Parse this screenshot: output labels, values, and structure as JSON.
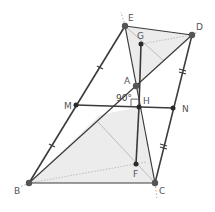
{
  "diagram": {
    "type": "geometry",
    "colors": {
      "line": "#3a3a3a",
      "thin_line": "#9a9a9a",
      "fill": "#e8e8e8",
      "point": "#2a2a2a"
    },
    "points": {
      "E": {
        "label": "E",
        "x": 125,
        "y": 26
      },
      "D": {
        "label": "D",
        "x": 192,
        "y": 35
      },
      "G": {
        "label": "G",
        "x": 141,
        "y": 44
      },
      "A": {
        "label": "A",
        "x": 136,
        "y": 86
      },
      "H": {
        "label": "H",
        "x": 139,
        "y": 107
      },
      "M": {
        "label": "M",
        "x": 76,
        "y": 105
      },
      "N": {
        "label": "N",
        "x": 173,
        "y": 108
      },
      "F": {
        "label": "F",
        "x": 136,
        "y": 164
      },
      "B": {
        "label": "B",
        "x": 29,
        "y": 183
      },
      "C": {
        "label": "C",
        "x": 155,
        "y": 183
      }
    },
    "angle_label": "90°"
  }
}
